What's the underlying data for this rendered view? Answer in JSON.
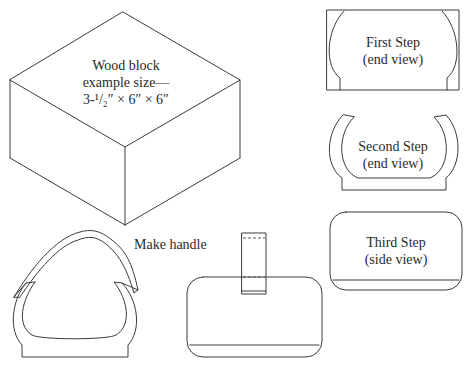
{
  "figure": {
    "block": {
      "line1": "Wood block",
      "line2": "example size—",
      "line3": "3-¹/₂″ × 6″ × 6″"
    },
    "steps": [
      {
        "title": "First Step",
        "view": "(end view)"
      },
      {
        "title": "Second Step",
        "view": "(end view)"
      },
      {
        "title": "Third Step",
        "view": "(side view)"
      }
    ],
    "handle_label": "Make handle"
  },
  "colors": {
    "line": "#3a3a3a",
    "background": "#ffffff"
  }
}
